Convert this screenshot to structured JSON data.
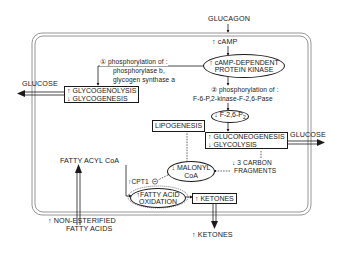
{
  "diagram": {
    "inputs": {
      "glucagon": "GLUCAGON",
      "camp": "↑ cAMP",
      "nefa_line1": "↑  NON-ESTERIFIED",
      "nefa_line2": "FATTY ACIDS"
    },
    "kinase": {
      "line1": "↑ cAMP-DEPENDENT",
      "line2": "PROTEIN KINASE"
    },
    "step1": {
      "line1": "① phosphorylation of :",
      "line2": "phosphorylase b,",
      "line3": "glycogen synthase a"
    },
    "step2": {
      "line1": "② phosphorylation of :",
      "line2": "F-6-P,2-kinase-F-2,6-Pase"
    },
    "f26p2": {
      "label": "↓ F-2,6-P",
      "subscript": "2"
    },
    "glycogen_box": {
      "line1": "↑ GLYCOGENOLYSIS",
      "line2": "↓ GLYCOGENESIS"
    },
    "glucose_left": "GLUCOSE",
    "glucose_right": "GLUCOSE",
    "lipogenesis": "LIPOGENESIS",
    "gluconeo_box": {
      "line1": "↑ GLUCONEOGENESIS",
      "line2": "↓ GLYCOLYSIS"
    },
    "carbon_fragments": {
      "line1": "↓ 3 CARBON",
      "line2": "FRAGMENTS"
    },
    "malonyl": {
      "line1": "↓ MALONYL",
      "line2": "CoA"
    },
    "fatty_acyl_coa": "FATTY ACYL  CoA",
    "cpt": "↑CPT1",
    "inhibit_symbol": "−",
    "fao": {
      "line1": "↑FATTY ACID",
      "line2": "OXIDATION"
    },
    "ketones_box": "↑ KETONES",
    "ketones_out": "↑ KETONES"
  },
  "colors": {
    "ink": "#1a1a1a",
    "frame": "#8a8a8a",
    "background": "#ffffff"
  }
}
